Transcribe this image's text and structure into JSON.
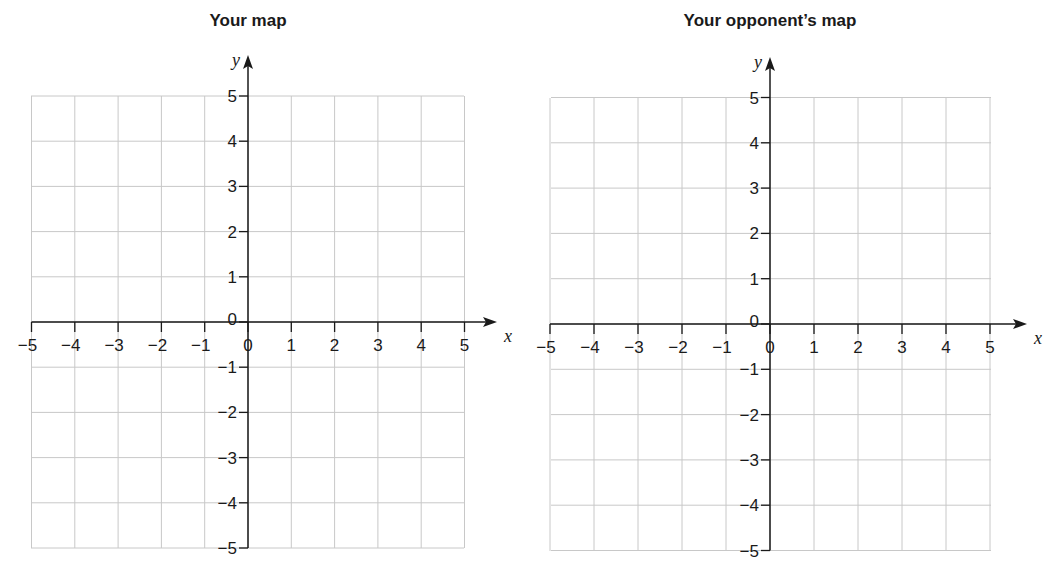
{
  "chart_data": [
    {
      "type": "coordinate-grid",
      "title": "Your map",
      "xlabel": "x",
      "ylabel": "y",
      "xlim": [
        -5,
        5
      ],
      "ylim": [
        -5,
        5
      ],
      "grid": true,
      "x_ticks": [
        -5,
        -4,
        -3,
        -2,
        -1,
        0,
        1,
        2,
        3,
        4,
        5
      ],
      "y_ticks": [
        -5,
        -4,
        -3,
        -2,
        -1,
        0,
        1,
        2,
        3,
        4,
        5
      ],
      "x_tick_labels": [
        "−5",
        "−4",
        "−3",
        "−2",
        "−1",
        "0",
        "1",
        "2",
        "3",
        "4",
        "5"
      ],
      "y_tick_labels": [
        "−5",
        "−4",
        "−3",
        "−2",
        "−1",
        "0",
        "1",
        "2",
        "3",
        "4",
        "5"
      ],
      "points": []
    },
    {
      "type": "coordinate-grid",
      "title": "Your opponent’s map",
      "xlabel": "x",
      "ylabel": "y",
      "xlim": [
        -5,
        5
      ],
      "ylim": [
        -5,
        5
      ],
      "grid": true,
      "x_ticks": [
        -5,
        -4,
        -3,
        -2,
        -1,
        0,
        1,
        2,
        3,
        4,
        5
      ],
      "y_ticks": [
        -5,
        -4,
        -3,
        -2,
        -1,
        0,
        1,
        2,
        3,
        4,
        5
      ],
      "x_tick_labels": [
        "−5",
        "−4",
        "−3",
        "−2",
        "−1",
        "0",
        "1",
        "2",
        "3",
        "4",
        "5"
      ],
      "y_tick_labels": [
        "−5",
        "−4",
        "−3",
        "−2",
        "−1",
        "0",
        "1",
        "2",
        "3",
        "4",
        "5"
      ],
      "points": []
    }
  ],
  "colors": {
    "grid": "#c8c8c8",
    "axis": "#1a1a1a",
    "background": "#ffffff"
  }
}
